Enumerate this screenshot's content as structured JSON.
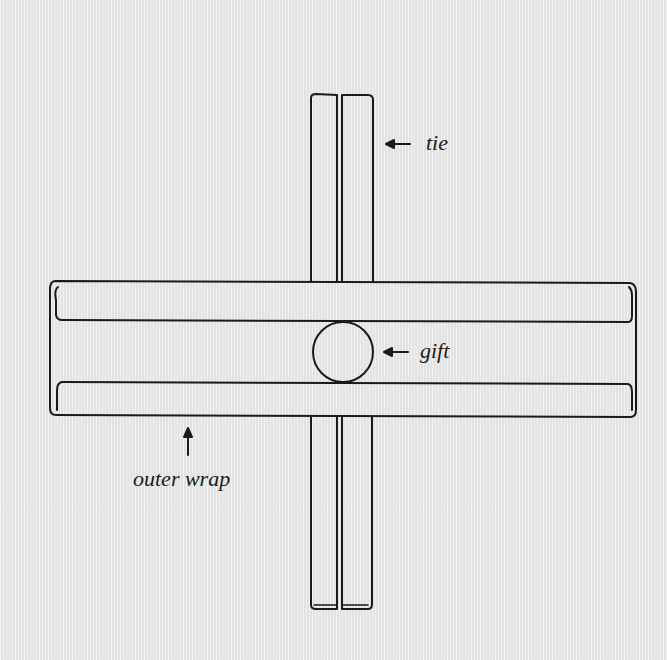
{
  "diagram": {
    "background_color": "#e9e9e9",
    "stroke_color": "#1a1a1a",
    "labels": {
      "tie": "tie",
      "gift": "gift",
      "outer_wrap": "outer wrap"
    },
    "parts": [
      "tie",
      "gift",
      "outer wrap"
    ]
  }
}
